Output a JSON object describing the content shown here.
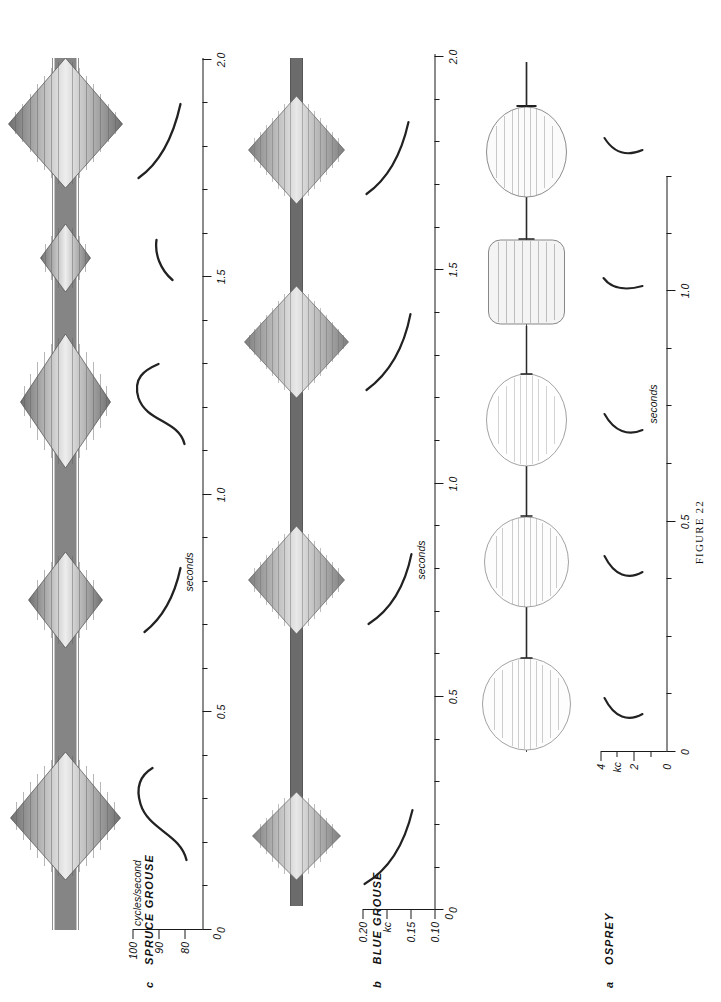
{
  "figure": {
    "caption": "FIGURE 22",
    "orientation": "rotated-90-ccw"
  },
  "panels": [
    {
      "letter": "a",
      "species": "OSPREY",
      "time_axis": {
        "name": "seconds",
        "ticks": [
          "0",
          "0.5",
          "1.0"
        ],
        "minor_tick_count": 3,
        "min": 0,
        "max": 1.25
      },
      "freq_axis": {
        "name": "kc",
        "ticks": [
          "0",
          "2",
          "4"
        ],
        "min": 0,
        "max": 5
      },
      "oscillogram": {
        "type": "burst-envelope",
        "burst_count": 6,
        "burst_times": [
          0.06,
          0.26,
          0.45,
          0.65,
          0.85,
          1.06
        ],
        "burst_amplitudes": [
          1.0,
          0.96,
          0.86,
          0.66,
          0.62,
          0.6
        ],
        "note": "six broad elliptical whistle envelopes"
      },
      "frequency_traces": {
        "count": 6,
        "shape": "short rising hook",
        "freq_low_kc": 2.0,
        "freq_high_kc": 3.1
      }
    },
    {
      "letter": "b",
      "species": "BLUE GROUSE",
      "time_axis": {
        "name": "seconds",
        "ticks": [
          "0",
          "0.5",
          "1.0",
          "1.5",
          "2.0"
        ],
        "minor_tick_count": 4,
        "min": 0,
        "max": 2.2
      },
      "freq_axis": {
        "name": "kc",
        "ticks": [
          "0",
          "0.10",
          "0.15",
          "0.20"
        ],
        "min": 0,
        "max": 0.22
      },
      "oscillogram": {
        "type": "burst-envelope",
        "burst_count": 4,
        "burst_times": [
          0.18,
          0.82,
          1.42,
          1.92
        ],
        "burst_amplitudes": [
          0.78,
          0.84,
          0.92,
          0.86
        ],
        "note": "four spindle-shaped low-frequency hoots"
      },
      "frequency_traces": {
        "count": 4,
        "shape": "descending arc",
        "freq_low_kc": 0.1,
        "freq_high_kc": 0.17
      }
    },
    {
      "letter": "c",
      "species": "SPRUCE GROUSE",
      "time_axis": {
        "name": "seconds",
        "ticks": [
          "0",
          "0.5",
          "1.0",
          "1.5",
          "2.0"
        ],
        "minor_tick_count": 4,
        "min": 0,
        "max": 2.2
      },
      "freq_axis": {
        "name": "cycles/second",
        "ticks": [
          "0",
          "80",
          "90",
          "100"
        ],
        "min": 0,
        "max": 108
      },
      "oscillogram": {
        "type": "burst-envelope",
        "burst_count": 5,
        "burst_times": [
          0.25,
          0.85,
          1.32,
          1.62,
          1.87
        ],
        "burst_amplitudes": [
          0.95,
          0.8,
          0.86,
          0.55,
          1.0
        ],
        "note": "five noisy drumming bursts with continuous low-level signal between"
      },
      "frequency_traces": {
        "count": 4,
        "shape": "S-curve / hook",
        "freq_low_cps": 80,
        "freq_high_cps": 100
      }
    }
  ],
  "colors": {
    "ink": "#1a1a1a",
    "paper": "#ffffff",
    "trace": "#222222"
  }
}
